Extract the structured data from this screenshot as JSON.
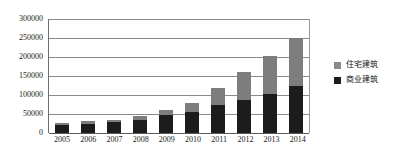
{
  "chart_data": {
    "type": "bar",
    "subtype": "stacked-column",
    "title": "",
    "xlabel": "",
    "ylabel": "",
    "categories": [
      "2005",
      "2006",
      "2007",
      "2008",
      "2009",
      "2010",
      "2011",
      "2012",
      "2013",
      "2014"
    ],
    "series": [
      {
        "name": "商业建筑",
        "color": "#1c1c1c",
        "values": [
          22000,
          25000,
          28000,
          35000,
          48000,
          56000,
          74000,
          87000,
          103000,
          125000
        ]
      },
      {
        "name": "住宅建筑",
        "color": "#7d7d7d",
        "values": [
          5000,
          6000,
          7000,
          9000,
          12000,
          22000,
          44000,
          74000,
          101000,
          125000
        ]
      }
    ],
    "totals": [
      27000,
      31000,
      35000,
      44000,
      60000,
      78000,
      118000,
      161000,
      204000,
      250000
    ],
    "stack_order": [
      "商业建筑",
      "住宅建筑"
    ],
    "ylim": [
      0,
      300000
    ],
    "ytick_values": [
      0,
      50000,
      100000,
      150000,
      200000,
      250000,
      300000
    ],
    "ytick_labels": [
      "0",
      "50000",
      "100000",
      "150000",
      "200000",
      "250000",
      "300000"
    ],
    "grid": true,
    "grid_axis": "y",
    "legend_position": "right"
  },
  "legend": {
    "entries": [
      {
        "label": "住宅建筑",
        "swatch": "residential-swatch"
      },
      {
        "label": "商业建筑",
        "swatch": "commercial-swatch"
      }
    ]
  }
}
